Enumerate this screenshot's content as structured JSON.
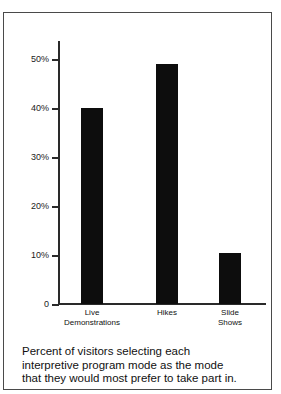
{
  "chart_data": {
    "type": "bar",
    "title": "",
    "xlabel": "",
    "ylabel": "",
    "categories": [
      "Live Demonstrations",
      "Hikes",
      "Slide Shows"
    ],
    "values": [
      40,
      49,
      10.5
    ],
    "ylim": [
      0,
      52
    ],
    "grid": false,
    "legend": null,
    "bar_color": "#0d0d0d",
    "y_ticks": [
      {
        "value": 50,
        "label": "50%"
      },
      {
        "value": 40,
        "label": "40%"
      },
      {
        "value": 30,
        "label": "30%"
      },
      {
        "value": 20,
        "label": "20%"
      },
      {
        "value": 10,
        "label": "10%"
      },
      {
        "value": 0,
        "label": "0"
      }
    ],
    "x_tick_labels": [
      {
        "line1": "Live",
        "line2": "Demonstrations"
      },
      {
        "line1": "Hikes",
        "line2": ""
      },
      {
        "line1": "Slide",
        "line2": "Shows"
      }
    ]
  },
  "caption": {
    "line1": "Percent of visitors selecting each",
    "line2": "interpretive program mode as the mode",
    "line3": "that they would most prefer to take part in."
  }
}
